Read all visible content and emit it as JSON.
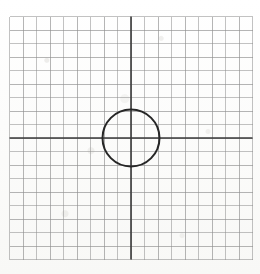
{
  "figure": {
    "kind": "geometry-diagram",
    "media": "scanned graph paper"
  },
  "canvas": {
    "width": 260,
    "height": 274,
    "background_color": "#fbfbfa",
    "paper_tint": "#f8f8f6"
  },
  "grid": {
    "origin_x": 131,
    "origin_y": 138,
    "cell_size": 13.5,
    "columns_left_of_axis": 9,
    "columns_right_of_axis": 9,
    "rows_above_axis": 9,
    "rows_below_axis": 9,
    "left_edge": 9.5,
    "top_edge": 16.5,
    "right_edge": 252.5,
    "bottom_edge": 259.5,
    "minor_line_color": "#8f8f8f",
    "minor_line_width": 0.9,
    "show_minor": true
  },
  "axes": {
    "x_axis_y": 138,
    "y_axis_x": 131,
    "color": "#3a3a3a",
    "line_width": 1.6,
    "x_axis_label": "",
    "y_axis_label": "",
    "tick_labels": []
  },
  "shapes": [
    {
      "name": "circle",
      "type": "circle",
      "center_x": 131,
      "center_y": 138,
      "radius": 28.5,
      "stroke_color": "#262626",
      "stroke_width": 2.0,
      "fill": "none",
      "hand_drawn": true
    }
  ],
  "annotations": {
    "labels": [],
    "notes": ""
  }
}
